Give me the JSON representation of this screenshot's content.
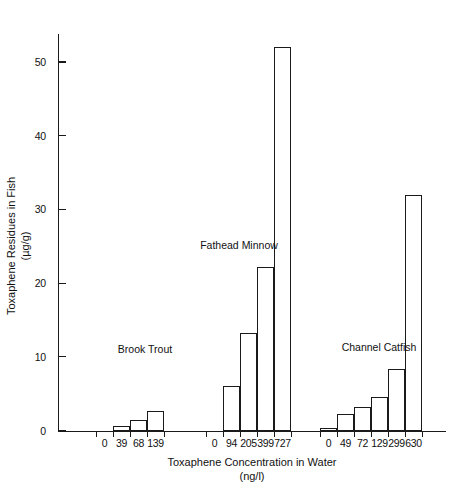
{
  "chart_data": {
    "type": "bar",
    "title": "",
    "xlabel": "Toxaphene Concentration in Water",
    "xlabel_units": "(ng/l)",
    "ylabel": "Toxaphene Residues in Fish",
    "ylabel_units": "(µg/g)",
    "ylim": [
      0,
      55
    ],
    "yticks": [
      0,
      10,
      20,
      30,
      40,
      50
    ],
    "ytick_labels": [
      "0",
      "10",
      "20",
      "30",
      "40",
      "50"
    ],
    "grid": false,
    "legend": "none",
    "groups": [
      {
        "name": "Brook Trout",
        "categories": [
          "0",
          "39",
          "68",
          "139"
        ],
        "values": [
          0,
          0.6,
          1.5,
          2.6
        ]
      },
      {
        "name": "Fathead Minnow",
        "categories": [
          "0",
          "94",
          "205",
          "399",
          "727"
        ],
        "values": [
          0,
          6.0,
          13.3,
          22.2,
          52.0
        ]
      },
      {
        "name": "Channel Catfish",
        "categories": [
          "0",
          "49",
          "72",
          "129",
          "299",
          "630"
        ],
        "values": [
          0.4,
          2.3,
          3.2,
          4.5,
          8.3,
          32.0
        ]
      }
    ]
  },
  "colors": {
    "axis": "#1a1a1a",
    "bar_fill": "#ffffff",
    "bar_stroke": "#1a1a1a",
    "background": "#ffffff"
  }
}
